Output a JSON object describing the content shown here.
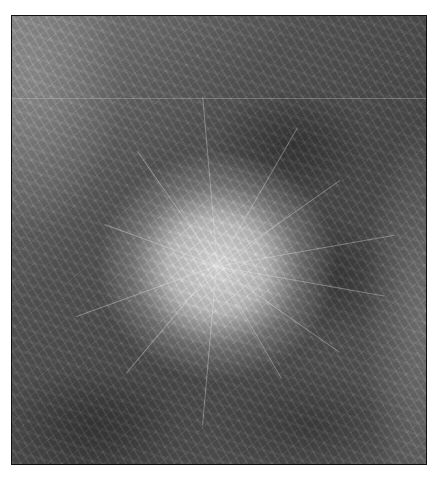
{
  "image": {
    "description": "Grayscale mammogram crop showing a bright, dense spiculated mass centered in the frame, surrounded by fibroglandular tissue texture",
    "palette": {
      "background": "#ffffff",
      "border": "#111111",
      "mass_center": "#f0f0f0",
      "tissue_dark": "#3c3c3c",
      "tissue_mid": "#6e6e6e"
    },
    "spicule_angles": [
      10,
      35,
      60,
      95,
      130,
      160,
      200,
      235,
      265,
      300,
      325,
      350
    ],
    "spicule_lengths": [
      170,
      150,
      130,
      160,
      140,
      150,
      120,
      140,
      170,
      160,
      150,
      180
    ]
  }
}
